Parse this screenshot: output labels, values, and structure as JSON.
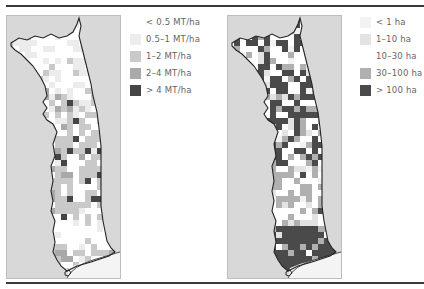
{
  "figure": {
    "panels": [
      {
        "id": "yield",
        "legend": [
          {
            "label": "< 0.5 MT/ha",
            "color": "#ffffff"
          },
          {
            "label": "0.5–1 MT/ha",
            "color": "#ececec"
          },
          {
            "label": "1–2 MT/ha",
            "color": "#c9c9c9"
          },
          {
            "label": "2–4 MT/ha",
            "color": "#a9a9a9"
          },
          {
            "label": "> 4 MT/ha",
            "color": "#454545"
          }
        ]
      },
      {
        "id": "area",
        "legend": [
          {
            "label": "< 1 ha",
            "color": "#f2f2f2"
          },
          {
            "label": "1–10 ha",
            "color": "#e3e3e3"
          },
          {
            "label": "10–30 ha",
            "color": "#ffffff"
          },
          {
            "label": "30–100 ha",
            "color": "#b0b0b0"
          },
          {
            "label": "> 100 ha",
            "color": "#4a4a4a"
          }
        ]
      }
    ],
    "colors": {
      "rule": "#3a3a3a",
      "map_background": "#d8d8d8",
      "map_frame_border": "#bdbdbd",
      "country_border": "#222222",
      "sea": "#f4f4f4"
    }
  }
}
